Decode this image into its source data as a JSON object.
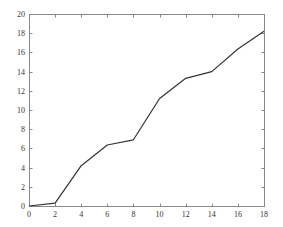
{
  "chart_data": {
    "type": "line",
    "title": "",
    "xlabel": "",
    "ylabel": "",
    "xlim": [
      0,
      18
    ],
    "ylim": [
      0,
      20
    ],
    "grid": false,
    "legend": null,
    "x_ticks": [
      0,
      2,
      4,
      6,
      8,
      10,
      12,
      14,
      16,
      18
    ],
    "y_ticks": [
      0,
      2,
      4,
      6,
      8,
      10,
      12,
      14,
      16,
      18,
      20
    ],
    "series": [
      {
        "name": "series-1",
        "color": "#333333",
        "x": [
          0,
          2,
          4,
          6,
          8,
          10,
          12,
          14,
          16,
          18
        ],
        "y": [
          0,
          0.3,
          4.2,
          6.35,
          6.9,
          11.2,
          13.3,
          14.0,
          16.35,
          18.2
        ]
      }
    ]
  },
  "layout": {
    "plot": {
      "left": 29,
      "top": 14,
      "right": 264,
      "bottom": 206
    },
    "axis_color": "#888888",
    "line_color": "#333333"
  }
}
